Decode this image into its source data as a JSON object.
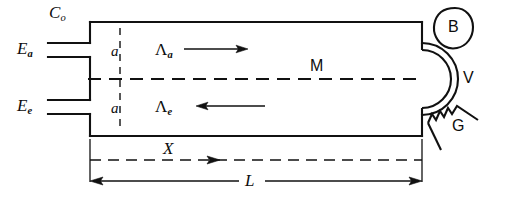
{
  "figure": {
    "type": "technical-schematic",
    "stroke_color": "#111111",
    "background_color": "#ffffff"
  },
  "labels": {
    "c_zero": {
      "base": "C",
      "sub": "o"
    },
    "e_a": {
      "base": "E",
      "sub": "a"
    },
    "e_e": {
      "base": "E",
      "sub": "e"
    },
    "a_upper": "a",
    "a_lower": "a",
    "lambda_a": {
      "base": "Λ",
      "sub": "a"
    },
    "lambda_e": {
      "base": "Λ",
      "sub": "e"
    },
    "m": "M",
    "b": "B",
    "v": "V",
    "g": "G",
    "x": "X",
    "l": "L"
  },
  "arrows": [
    {
      "name": "lambda-a-arrow",
      "direction": "right",
      "label": "Λa"
    },
    {
      "name": "lambda-e-arrow",
      "direction": "left",
      "label": "Λe"
    },
    {
      "name": "x-arrow",
      "direction": "right",
      "label": "X"
    },
    {
      "name": "l-dimension-arrow",
      "direction": "both",
      "label": "L"
    }
  ],
  "elements": [
    {
      "name": "column-body",
      "shape": "rectangle"
    },
    {
      "name": "inlet-pipe-ea",
      "shape": "double-line"
    },
    {
      "name": "inlet-pipe-ee",
      "shape": "double-line"
    },
    {
      "name": "section-line-a",
      "shape": "vertical-dashed"
    },
    {
      "name": "centerline-m",
      "shape": "horizontal-dashed"
    },
    {
      "name": "dome-v",
      "shape": "semicircle"
    },
    {
      "name": "blob-b",
      "shape": "irregular-oval"
    },
    {
      "name": "zigzag-g",
      "shape": "wedge-zigzag"
    },
    {
      "name": "x-dimension",
      "shape": "horizontal-dashed-arrow"
    },
    {
      "name": "l-dimension",
      "shape": "double-arrow-line"
    }
  ]
}
